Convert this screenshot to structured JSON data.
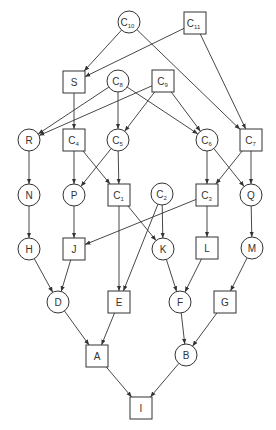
{
  "diagram": {
    "type": "directed-acyclic-graph",
    "colors": {
      "stroke": "#333333",
      "fill": "#ffffff",
      "background": "#ffffff"
    },
    "nodes": [
      {
        "id": "C10",
        "label": "C",
        "sub": "10",
        "shape": "circle",
        "x": 129,
        "y": 22
      },
      {
        "id": "C11",
        "label": "C",
        "sub": "11",
        "shape": "square",
        "x": 195,
        "y": 23
      },
      {
        "id": "S",
        "label": "S",
        "sub": "",
        "shape": "square",
        "x": 74,
        "y": 82
      },
      {
        "id": "C8",
        "label": "C",
        "sub": "8",
        "shape": "circle",
        "x": 118,
        "y": 81
      },
      {
        "id": "C9",
        "label": "C",
        "sub": "9",
        "shape": "square",
        "x": 163,
        "y": 81
      },
      {
        "id": "R",
        "label": "R",
        "sub": "",
        "shape": "circle",
        "x": 29,
        "y": 140
      },
      {
        "id": "C4",
        "label": "C",
        "sub": "4",
        "shape": "square",
        "x": 74,
        "y": 140
      },
      {
        "id": "C5",
        "label": "C",
        "sub": "5",
        "shape": "circle",
        "x": 118,
        "y": 140
      },
      {
        "id": "C6",
        "label": "C",
        "sub": "6",
        "shape": "circle",
        "x": 207,
        "y": 140
      },
      {
        "id": "C7",
        "label": "C",
        "sub": "7",
        "shape": "square",
        "x": 251,
        "y": 140
      },
      {
        "id": "N",
        "label": "N",
        "sub": "",
        "shape": "circle",
        "x": 29,
        "y": 195
      },
      {
        "id": "P",
        "label": "P",
        "sub": "",
        "shape": "circle",
        "x": 74,
        "y": 195
      },
      {
        "id": "C1",
        "label": "C",
        "sub": "1",
        "shape": "square",
        "x": 119,
        "y": 195
      },
      {
        "id": "C2",
        "label": "C",
        "sub": "2",
        "shape": "circle",
        "x": 162,
        "y": 194
      },
      {
        "id": "C3",
        "label": "C",
        "sub": "3",
        "shape": "square",
        "x": 207,
        "y": 195
      },
      {
        "id": "Q",
        "label": "Q",
        "sub": "",
        "shape": "circle",
        "x": 251,
        "y": 195
      },
      {
        "id": "H",
        "label": "H",
        "sub": "",
        "shape": "circle",
        "x": 29,
        "y": 249
      },
      {
        "id": "J",
        "label": "J",
        "sub": "",
        "shape": "square",
        "x": 74,
        "y": 249
      },
      {
        "id": "K",
        "label": "K",
        "sub": "",
        "shape": "circle",
        "x": 163,
        "y": 249
      },
      {
        "id": "L",
        "label": "L",
        "sub": "",
        "shape": "square",
        "x": 207,
        "y": 248
      },
      {
        "id": "M",
        "label": "M",
        "sub": "",
        "shape": "circle",
        "x": 252,
        "y": 248
      },
      {
        "id": "D",
        "label": "D",
        "sub": "",
        "shape": "circle",
        "x": 58,
        "y": 302
      },
      {
        "id": "E",
        "label": "E",
        "sub": "",
        "shape": "square",
        "x": 119,
        "y": 302
      },
      {
        "id": "F",
        "label": "F",
        "sub": "",
        "shape": "circle",
        "x": 180,
        "y": 302
      },
      {
        "id": "G",
        "label": "G",
        "sub": "",
        "shape": "square",
        "x": 225,
        "y": 302
      },
      {
        "id": "A",
        "label": "A",
        "sub": "",
        "shape": "square",
        "x": 97,
        "y": 356
      },
      {
        "id": "B",
        "label": "B",
        "sub": "",
        "shape": "circle",
        "x": 186,
        "y": 355
      },
      {
        "id": "I",
        "label": "I",
        "sub": "",
        "shape": "square",
        "x": 141,
        "y": 408
      }
    ],
    "edges": [
      [
        "C10",
        "S"
      ],
      [
        "C10",
        "C7"
      ],
      [
        "C11",
        "S"
      ],
      [
        "C11",
        "C7"
      ],
      [
        "S",
        "C4"
      ],
      [
        "C8",
        "R"
      ],
      [
        "C8",
        "C5"
      ],
      [
        "C8",
        "C6"
      ],
      [
        "C9",
        "R"
      ],
      [
        "C9",
        "C5"
      ],
      [
        "C9",
        "C6"
      ],
      [
        "R",
        "N"
      ],
      [
        "C4",
        "P"
      ],
      [
        "C4",
        "C1"
      ],
      [
        "C5",
        "P"
      ],
      [
        "C5",
        "C1"
      ],
      [
        "C6",
        "C3"
      ],
      [
        "C6",
        "Q"
      ],
      [
        "C7",
        "C3"
      ],
      [
        "C7",
        "Q"
      ],
      [
        "N",
        "H"
      ],
      [
        "P",
        "J"
      ],
      [
        "C1",
        "K"
      ],
      [
        "C1",
        "E"
      ],
      [
        "C2",
        "K"
      ],
      [
        "C2",
        "E"
      ],
      [
        "C3",
        "J"
      ],
      [
        "C3",
        "L"
      ],
      [
        "Q",
        "M"
      ],
      [
        "H",
        "D"
      ],
      [
        "J",
        "D"
      ],
      [
        "K",
        "F"
      ],
      [
        "L",
        "F"
      ],
      [
        "M",
        "G"
      ],
      [
        "D",
        "A"
      ],
      [
        "E",
        "A"
      ],
      [
        "F",
        "B"
      ],
      [
        "G",
        "B"
      ],
      [
        "A",
        "I"
      ],
      [
        "B",
        "I"
      ]
    ]
  }
}
